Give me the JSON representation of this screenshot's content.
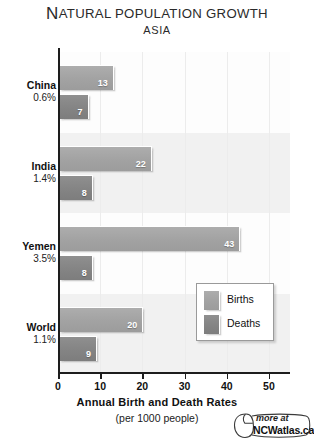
{
  "header": {
    "title_first_letter": "N",
    "title_rest": "atural Population Growth",
    "title_full": "NATURAL POPULATION GROWTH",
    "subtitle": "ASIA"
  },
  "legend": {
    "items": [
      {
        "label": "Births",
        "color": "#a2a2a2",
        "swatch_name": "births-swatch"
      },
      {
        "label": "Deaths",
        "color": "#848484",
        "swatch_name": "deaths-swatch"
      }
    ]
  },
  "axis": {
    "title": "Annual Birth and Death Rates",
    "subtitle": "(per 1000 people)",
    "tick_labels": [
      "0",
      "10",
      "20",
      "30",
      "40",
      "50"
    ]
  },
  "footer": {
    "more_at": "more at",
    "site": "NCWatlas.ca",
    "icon": "computer-mouse-icon"
  },
  "groups": [
    {
      "name": "China",
      "rate": "0.6%",
      "births": "13",
      "deaths": "7"
    },
    {
      "name": "India",
      "rate": "1.4%",
      "births": "22",
      "deaths": "8"
    },
    {
      "name": "Yemen",
      "rate": "3.5%",
      "births": "43",
      "deaths": "8"
    },
    {
      "name": "World",
      "rate": "1.1%",
      "births": "20",
      "deaths": "9"
    }
  ],
  "chart_data": {
    "type": "bar",
    "title": "Natural Population Growth",
    "subtitle": "Asia",
    "orientation": "horizontal",
    "grouped": true,
    "categories": [
      "China",
      "India",
      "Yemen",
      "World"
    ],
    "category_annotations": [
      "0.6%",
      "1.4%",
      "3.5%",
      "1.1%"
    ],
    "series": [
      {
        "name": "Births",
        "values": [
          13,
          22,
          43,
          20
        ],
        "color": "#a2a2a2"
      },
      {
        "name": "Deaths",
        "values": [
          7,
          8,
          8,
          9
        ],
        "color": "#848484"
      }
    ],
    "xlabel": "Annual Birth and Death Rates (per 1000 people)",
    "ylabel": "",
    "xlim": [
      0,
      55
    ],
    "xticks": [
      0,
      10,
      20,
      30,
      40,
      50
    ],
    "grid": true,
    "grid_axis": "x",
    "legend_position": "inside-bottom-right",
    "data_labels": true,
    "note": "Category annotations are natural population growth rates (percent per year)."
  }
}
